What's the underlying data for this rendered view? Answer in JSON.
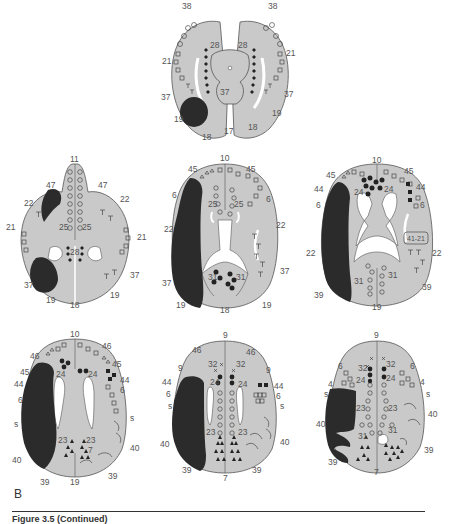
{
  "figure": {
    "panel_label": "B",
    "caption": "Figure 3.5 (Continued)",
    "colors": {
      "brain_fill": "#c9c9c9",
      "brain_outline": "#555555",
      "ventricle": "#ffffff",
      "lesion": "#2b2b2b",
      "label_text": "#555555"
    },
    "legend_symbols": [
      "open-circle",
      "filled-circle",
      "open-square",
      "filled-square",
      "open-triangle",
      "filled-triangle",
      "T-mark",
      "cross-mark",
      "diamond"
    ],
    "slices": [
      {
        "id": "slice-1",
        "position": "top-center",
        "labels": {
          "l38a": "38",
          "l38b": "38",
          "l28a": "28",
          "l28b": "28",
          "l21a": "21",
          "l21b": "21",
          "l37a": "37",
          "l37b": "37",
          "l37c": "37",
          "l19a": "19",
          "l19b": "19",
          "l18a": "18",
          "l18b": "18",
          "l17": "17"
        }
      },
      {
        "id": "slice-2",
        "position": "middle-left",
        "labels": {
          "l11": "11",
          "l47a": "47",
          "l47b": "47",
          "l22a": "22",
          "l22b": "22",
          "l21a": "21",
          "l21b": "21",
          "l25a": "25",
          "l25b": "25",
          "l28": "28",
          "l37a": "37",
          "l37b": "37",
          "l19a": "19",
          "l19b": "19",
          "l18": "18"
        }
      },
      {
        "id": "slice-3",
        "position": "middle-center",
        "labels": {
          "l10": "10",
          "l45a": "45",
          "l45b": "45",
          "l6a": "6",
          "l6b": "6",
          "l25a": "25",
          "l25b": "25",
          "l22a": "22",
          "l22b": "22",
          "l37a": "37",
          "l37b": "37",
          "l31a": "31",
          "l31b": "31",
          "l19a": "19",
          "l19b": "19",
          "l18": "18"
        }
      },
      {
        "id": "slice-4",
        "position": "middle-right",
        "labels": {
          "l10": "10",
          "l45a": "45",
          "l45b": "45",
          "l44a": "44",
          "l44b": "44",
          "l6a": "6",
          "l6b": "6",
          "l24a": "24",
          "l24b": "24",
          "l22a": "22",
          "l22b": "22",
          "l4121": "41-21",
          "l31a": "31",
          "l31b": "31",
          "l39a": "39",
          "l39b": "39",
          "l19": "19"
        }
      },
      {
        "id": "slice-5",
        "position": "bottom-left",
        "labels": {
          "l10": "10",
          "l46a": "46",
          "l46b": "46",
          "l45a": "45",
          "l45b": "45",
          "l44a": "44",
          "l44b": "44",
          "l6a": "6",
          "l6b": "6",
          "l24a": "24",
          "l24b": "24",
          "lsa": "s",
          "lsb": "s",
          "l23a": "23",
          "l23b": "23",
          "l7": "7",
          "l40a": "40",
          "l40b": "40",
          "l39a": "39",
          "l39b": "39",
          "l19": "19"
        }
      },
      {
        "id": "slice-6",
        "position": "bottom-center",
        "labels": {
          "l9a": "9",
          "l9b": "9",
          "l9c": "9",
          "l46a": "46",
          "l46b": "46",
          "l32a": "32",
          "l32b": "32",
          "l44a": "44",
          "l44b": "44",
          "l6a": "6",
          "l6b": "6",
          "l24a": "24",
          "l24b": "24",
          "lsa": "s",
          "lsb": "s",
          "l23a": "23",
          "l23b": "23",
          "l40a": "40",
          "l40b": "40",
          "l39a": "39",
          "l39b": "39",
          "l7": "7"
        }
      },
      {
        "id": "slice-7",
        "position": "bottom-right",
        "labels": {
          "l9": "9",
          "l6a": "6",
          "l6b": "6",
          "l32a": "32",
          "l32b": "32",
          "l24a": "24",
          "l24b": "24",
          "l4a": "4",
          "l4b": "4",
          "lsa": "s",
          "lsb": "s",
          "l23a": "23",
          "l23b": "23",
          "l40a": "40",
          "l40b": "40",
          "l31a": "31",
          "l31b": "31",
          "l39a": "39",
          "l39b": "39",
          "l7": "7"
        }
      }
    ]
  }
}
